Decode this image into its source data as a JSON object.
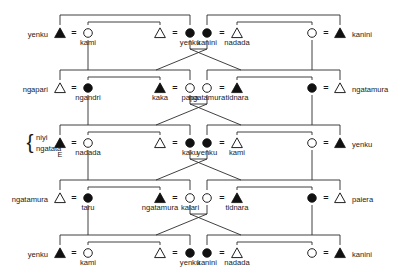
{
  "figure": {
    "type": "kinship-diagram",
    "symbols": {
      "male_filled": "filled-triangle",
      "male_open": "open-triangle",
      "female_filled": "filled-circle",
      "female_open": "open-circle",
      "marriage": "=",
      "descent": "vertical-line",
      "sibling": "horizontal-bracket"
    },
    "ego_marker": "E",
    "brace_label_line1": "niyi",
    "brace_label_line2": "ngatata",
    "rows": [
      {
        "id": "row-1",
        "persons": [
          {
            "sym": "male_filled",
            "label": "yenku",
            "label_pos": "left"
          },
          {
            "sym": "female_open",
            "label": "kami",
            "label_pos": "below"
          },
          {
            "sym": "male_open",
            "label": "",
            "label_pos": "below"
          },
          {
            "sym": "female_filled",
            "label": "yenku",
            "label_pos": "below"
          },
          {
            "sym": "female_filled",
            "label": "kanini",
            "label_pos": "below"
          },
          {
            "sym": "male_open",
            "label": "nadada",
            "label_pos": "below"
          },
          {
            "sym": "female_open",
            "label": "",
            "label_pos": "below"
          },
          {
            "sym": "male_filled",
            "label": "kanini",
            "label_pos": "right"
          }
        ]
      },
      {
        "id": "row-2",
        "persons": [
          {
            "sym": "male_open",
            "label": "ngapari",
            "label_pos": "left"
          },
          {
            "sym": "female_filled",
            "label": "ngandri",
            "label_pos": "below"
          },
          {
            "sym": "male_filled",
            "label": "kaka",
            "label_pos": "below"
          },
          {
            "sym": "female_open",
            "label": "papa",
            "label_pos": "below"
          },
          {
            "sym": "female_open",
            "label": "ngatamura",
            "label_pos": "below"
          },
          {
            "sym": "male_filled",
            "label": "tidnara",
            "label_pos": "below"
          },
          {
            "sym": "female_filled",
            "label": "",
            "label_pos": "below"
          },
          {
            "sym": "male_open",
            "label": "ngatamura",
            "label_pos": "right"
          }
        ]
      },
      {
        "id": "row-3",
        "persons": [
          {
            "sym": "male_filled",
            "label": "",
            "label_pos": "left"
          },
          {
            "sym": "female_open",
            "label": "nadada",
            "label_pos": "below"
          },
          {
            "sym": "male_open",
            "label": "",
            "label_pos": "below"
          },
          {
            "sym": "female_filled",
            "label": "kaku",
            "label_pos": "below"
          },
          {
            "sym": "female_filled",
            "label": "yenku",
            "label_pos": "below"
          },
          {
            "sym": "male_open",
            "label": "kami",
            "label_pos": "below"
          },
          {
            "sym": "female_open",
            "label": "",
            "label_pos": "below"
          },
          {
            "sym": "male_filled",
            "label": "yenku",
            "label_pos": "right"
          }
        ]
      },
      {
        "id": "row-4",
        "persons": [
          {
            "sym": "male_open",
            "label": "ngatamura",
            "label_pos": "left"
          },
          {
            "sym": "female_filled",
            "label": "taru",
            "label_pos": "below"
          },
          {
            "sym": "male_filled",
            "label": "ngatamura",
            "label_pos": "below"
          },
          {
            "sym": "female_open",
            "label": "kalari",
            "label_pos": "below"
          },
          {
            "sym": "female_open",
            "label": "",
            "label_pos": "below"
          },
          {
            "sym": "male_filled",
            "label": "tidnara",
            "label_pos": "below"
          },
          {
            "sym": "female_filled",
            "label": "",
            "label_pos": "below"
          },
          {
            "sym": "male_open",
            "label": "paiera",
            "label_pos": "right"
          }
        ]
      },
      {
        "id": "row-5",
        "persons": [
          {
            "sym": "male_filled",
            "label": "yenku",
            "label_pos": "left"
          },
          {
            "sym": "female_open",
            "label": "kami",
            "label_pos": "below"
          },
          {
            "sym": "male_open",
            "label": "",
            "label_pos": "below"
          },
          {
            "sym": "female_filled",
            "label": "yenku",
            "label_pos": "below"
          },
          {
            "sym": "female_filled",
            "label": "kanini",
            "label_pos": "below"
          },
          {
            "sym": "male_open",
            "label": "nadada",
            "label_pos": "below"
          },
          {
            "sym": "female_open",
            "label": "",
            "label_pos": "below"
          },
          {
            "sym": "male_filled",
            "label": "kanini",
            "label_pos": "right"
          }
        ]
      }
    ],
    "colors": {
      "line": "#2b2b2b",
      "fill_dark": "#111111",
      "fill_light": "#ffffff",
      "text": "#1a1a1a",
      "background": "#ffffff"
    }
  }
}
